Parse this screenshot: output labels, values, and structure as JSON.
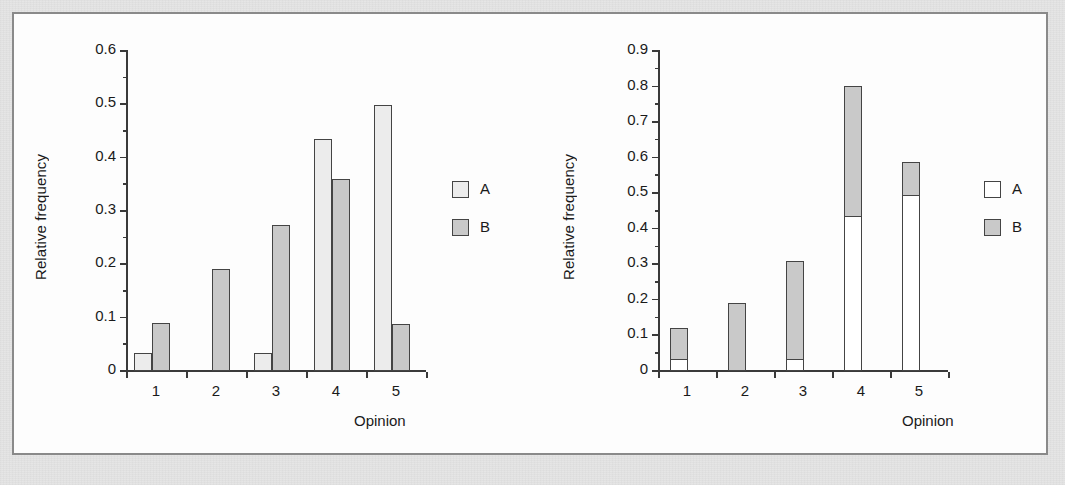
{
  "figure": {
    "panels": [
      {
        "id": "left",
        "kind": "grouped-bar",
        "x_axis_title": "Opinion",
        "y_axis_title": "Relative frequency",
        "y_ticks": [
          "0.6",
          "0.5",
          "0.4",
          "0.3",
          "0.2",
          "0.1",
          "0"
        ],
        "x_ticks": [
          "1",
          "2",
          "3",
          "4",
          "5"
        ],
        "legend": [
          {
            "label": "A",
            "swatch": "legend-swatch-a",
            "color": "#ececec"
          },
          {
            "label": "B",
            "swatch": "legend-swatch-b",
            "color": "#c9c9c9"
          }
        ]
      },
      {
        "id": "right",
        "kind": "stacked-bar",
        "x_axis_title": "Opinion",
        "y_axis_title": "Relative frequency",
        "y_ticks": [
          "0.9",
          "0.8",
          "0.7",
          "0.6",
          "0.5",
          "0.4",
          "0.3",
          "0.2",
          "0.1",
          "0"
        ],
        "x_ticks": [
          "1",
          "2",
          "3",
          "4",
          "5"
        ],
        "legend": [
          {
            "label": "A",
            "swatch": "legend-swatch-a",
            "color": "#ffffff"
          },
          {
            "label": "B",
            "swatch": "legend-swatch-b",
            "color": "#c9c9c9"
          }
        ]
      }
    ]
  },
  "chart_data": [
    {
      "type": "bar",
      "subtype": "grouped",
      "title": "",
      "xlabel": "Opinion",
      "ylabel": "Relative frequency",
      "categories": [
        "1",
        "2",
        "3",
        "4",
        "5"
      ],
      "series": [
        {
          "name": "A",
          "values": [
            0.032,
            0.0,
            0.031,
            0.434,
            0.497
          ],
          "color": "#ececec"
        },
        {
          "name": "B",
          "values": [
            0.088,
            0.189,
            0.272,
            0.359,
            0.086
          ],
          "color": "#c9c9c9"
        }
      ],
      "ylim": [
        0,
        0.6
      ],
      "ytick_values": [
        0,
        0.1,
        0.2,
        0.3,
        0.4,
        0.5,
        0.6
      ],
      "grid": false,
      "legend_position": "right"
    },
    {
      "type": "bar",
      "subtype": "stacked",
      "title": "",
      "xlabel": "Opinion",
      "ylabel": "Relative frequency",
      "categories": [
        "1",
        "2",
        "3",
        "4",
        "5"
      ],
      "series": [
        {
          "name": "A",
          "values": [
            0.033,
            0.0,
            0.031,
            0.434,
            0.494
          ],
          "color": "#ffffff"
        },
        {
          "name": "B",
          "values": [
            0.085,
            0.189,
            0.276,
            0.366,
            0.09
          ],
          "color": "#c9c9c9"
        }
      ],
      "totals": [
        0.118,
        0.189,
        0.307,
        0.8,
        0.584
      ],
      "ylim": [
        0,
        0.9
      ],
      "ytick_values": [
        0,
        0.1,
        0.2,
        0.3,
        0.4,
        0.5,
        0.6,
        0.7,
        0.8,
        0.9
      ],
      "grid": false,
      "legend_position": "right"
    }
  ]
}
